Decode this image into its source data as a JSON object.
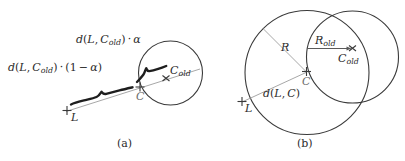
{
  "figure": {
    "caption_a": "(a)",
    "caption_b": "(b)",
    "panel_a": {
      "label_alpha_segment": "d(L, Cold) · α",
      "label_one_minus_alpha_segment": "d(L, Cold) · (1 − α)",
      "point_L": "L",
      "point_C": "C",
      "point_C_old": "Cold",
      "markers": {
        "L": "plus-marker",
        "C": "plus-marker",
        "C_old": "cross-marker"
      }
    },
    "panel_b": {
      "label_R": "R",
      "label_R_old": "Rold",
      "label_d_L_C": "d(L, C)",
      "point_L": "L",
      "point_C": "C",
      "point_C_old": "Cold",
      "markers": {
        "L": "plus-marker",
        "C": "plus-marker",
        "C_old": "cross-marker"
      }
    },
    "colors": {
      "stroke_dark": "#3a3a3a",
      "stroke_light": "#a0a0a0",
      "text": "#2b2b2b",
      "background": "#ffffff"
    }
  }
}
